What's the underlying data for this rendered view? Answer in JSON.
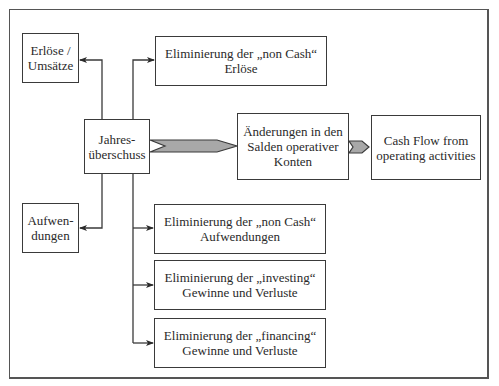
{
  "diagram": {
    "nodes": {
      "erloese": {
        "line1": "Erlöse /",
        "line2": "Umsätze"
      },
      "elim_noncash_erloese": {
        "line1": "Eliminierung der „non Cash“",
        "line2": "Erlöse"
      },
      "jahresueberschuss": {
        "line1": "Jahres-",
        "line2": "überschuss"
      },
      "aenderungen": {
        "line1": "Änderungen in den",
        "line2": "Salden operativer",
        "line3": "Konten"
      },
      "cash_flow": {
        "line1": "Cash Flow from",
        "line2": "operating activities"
      },
      "aufwendungen": {
        "line1": "Aufwen-",
        "line2": "dungen"
      },
      "elim_noncash_aufwendungen": {
        "line1": "Eliminierung der „non Cash“",
        "line2": "Aufwendungen"
      },
      "elim_investing": {
        "line1": "Eliminierung der „investing“",
        "line2": "Gewinne und Verluste"
      },
      "elim_financing": {
        "line1": "Eliminierung der „financing“",
        "line2": "Gewinne und Verluste"
      }
    },
    "edges": [
      {
        "from": "jahresueberschuss",
        "to": "erloese",
        "style": "arrow"
      },
      {
        "from": "jahresueberschuss",
        "to": "elim_noncash_erloese",
        "style": "arrow"
      },
      {
        "from": "jahresueberschuss",
        "to": "aufwendungen",
        "style": "arrow"
      },
      {
        "from": "jahresueberschuss",
        "to": "elim_noncash_aufwendungen",
        "style": "arrow"
      },
      {
        "from": "jahresueberschuss",
        "to": "elim_investing",
        "style": "arrow"
      },
      {
        "from": "jahresueberschuss",
        "to": "elim_financing",
        "style": "arrow"
      },
      {
        "from": "jahresueberschuss",
        "to": "aenderungen",
        "style": "chevron"
      },
      {
        "from": "aenderungen",
        "to": "cash_flow",
        "style": "chevron"
      }
    ],
    "colors": {
      "line": "#3a3a3a",
      "chevron_fill": "#a8a8a8",
      "frame": "#555555"
    }
  }
}
